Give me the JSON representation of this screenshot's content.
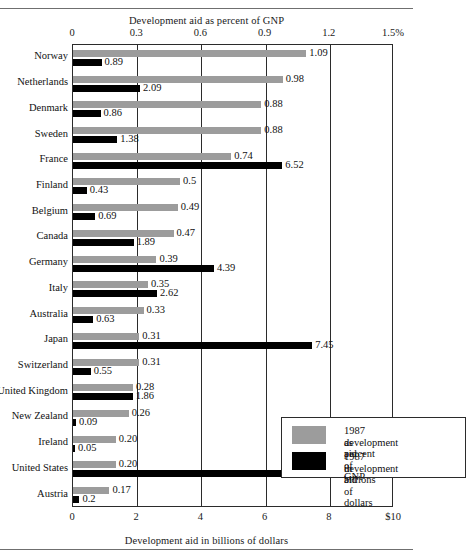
{
  "figure": {
    "top_axis_title": "Development aid as percent of GNP",
    "bottom_axis_title": "Development aid in billions of dollars"
  },
  "legend": {
    "entries": [
      {
        "swatch": "gray-swatch",
        "line1": "1987 development aid",
        "line2": "as percent of GNP"
      },
      {
        "swatch": "black-swatch",
        "line1": "1987 development aid",
        "line2": "in billions of dollars"
      }
    ]
  },
  "colors": {
    "percent_series": "#9c9c9c",
    "dollars_series": "#000000",
    "frame": "#2b2b2b"
  },
  "chart_data": {
    "type": "bar",
    "orientation": "horizontal",
    "title": "",
    "categories": [
      "Norway",
      "Netherlands",
      "Denmark",
      "Sweden",
      "France",
      "Finland",
      "Belgium",
      "Canada",
      "Germany",
      "Italy",
      "Australia",
      "Japan",
      "Switzerland",
      "United Kingdom",
      "New Zealand",
      "Ireland",
      "United States",
      "Austria"
    ],
    "series": [
      {
        "name": "1987 development aid as percent of GNP",
        "color": "#9c9c9c",
        "axis": "top",
        "unit": "percent of GNP",
        "values": [
          1.09,
          0.98,
          0.88,
          0.88,
          0.74,
          0.5,
          0.49,
          0.47,
          0.39,
          0.35,
          0.33,
          0.31,
          0.31,
          0.28,
          0.26,
          0.2,
          0.2,
          0.17
        ],
        "labels": [
          "1.09",
          "0.98",
          "0.88",
          "0.88",
          "0.74",
          "0.5",
          "0.49",
          "0.47",
          "0.39",
          "0.35",
          "0.33",
          "0.31",
          "0.31",
          "0.28",
          "0.26",
          "0.20",
          "0.20",
          "0.17"
        ]
      },
      {
        "name": "1987 development aid in billions of dollars",
        "color": "#000000",
        "axis": "bottom",
        "unit": "billions of dollars",
        "values": [
          0.89,
          2.09,
          0.86,
          1.38,
          6.52,
          0.43,
          0.69,
          1.89,
          4.39,
          2.62,
          0.63,
          7.45,
          0.55,
          1.86,
          0.09,
          0.05,
          8.95,
          0.2
        ],
        "labels": [
          "0.89",
          "2.09",
          "0.86",
          "1.38",
          "6.52",
          "0.43",
          "0.69",
          "1.89",
          "4.39",
          "2.62",
          "0.63",
          "7.45",
          "0.55",
          "1.86",
          "0.09",
          "0.05",
          "8.95",
          "0.2"
        ]
      }
    ],
    "top_axis": {
      "label": "Development aid as percent of GNP",
      "ticks": [
        0,
        0.3,
        0.6,
        0.9,
        1.2,
        1.5
      ],
      "tick_labels": [
        "0",
        "0.3",
        "0.6",
        "0.9",
        "1.2",
        "1.5%"
      ],
      "min": 0,
      "max": 1.5
    },
    "bottom_axis": {
      "label": "Development aid in billions of dollars",
      "ticks": [
        0,
        2,
        4,
        6,
        8,
        10
      ],
      "tick_labels": [
        "0",
        "2",
        "4",
        "6",
        "8",
        "$10"
      ],
      "min": 0,
      "max": 10
    },
    "grid": true,
    "legend_position": "inside-lower-right"
  }
}
